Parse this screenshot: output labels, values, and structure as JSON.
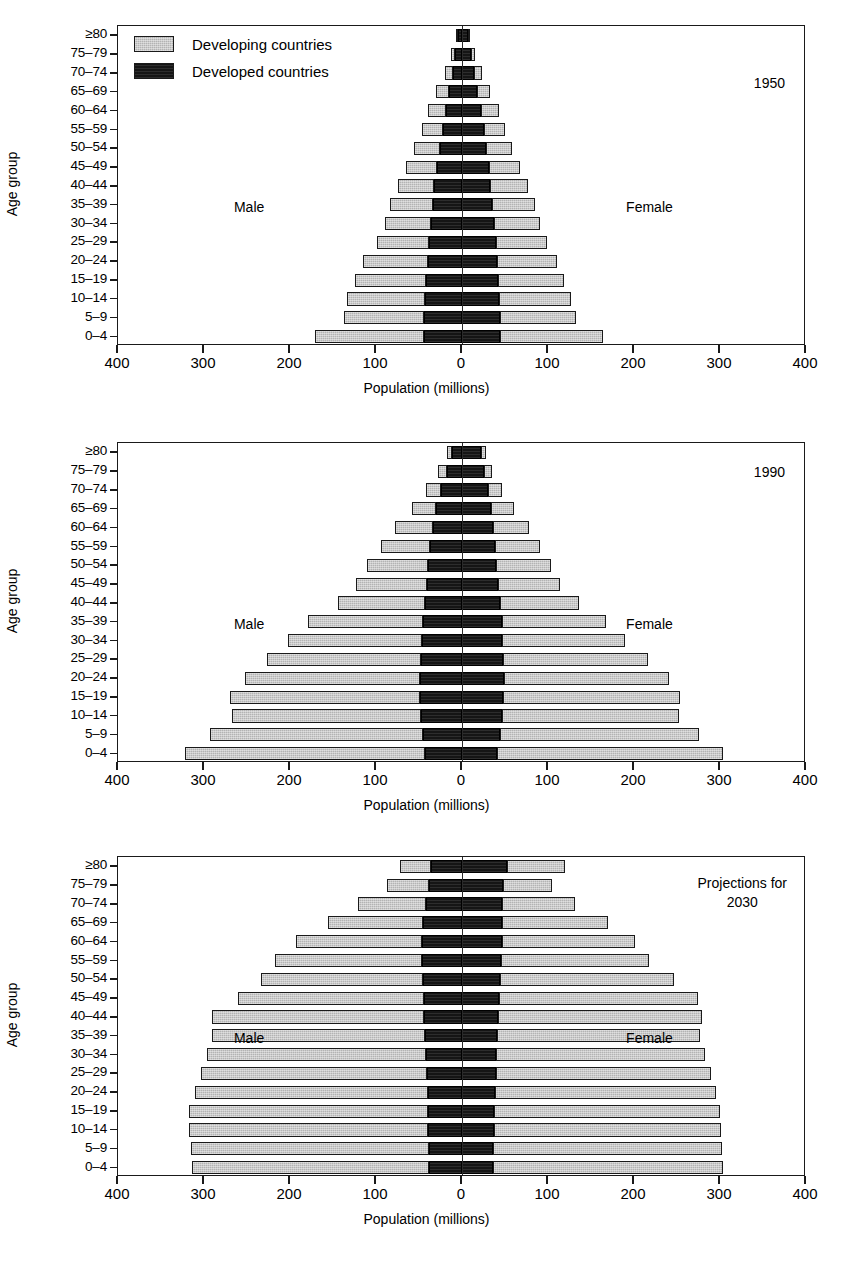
{
  "figure": {
    "axis_title_x": "Population (millions)",
    "axis_title_y": "Age group",
    "male_label": "Male",
    "female_label": "Female",
    "x_tick_labels": [
      "400",
      "300",
      "200",
      "100",
      "0",
      "100",
      "200",
      "300",
      "400"
    ],
    "x_tick_values": [
      -400,
      -300,
      -200,
      -100,
      0,
      100,
      200,
      300,
      400
    ],
    "xlim": [
      -400,
      400
    ],
    "age_groups": [
      "≥80",
      "75–79",
      "70–74",
      "65–69",
      "60–64",
      "55–59",
      "50–54",
      "45–49",
      "40–44",
      "35–39",
      "30–34",
      "25–29",
      "20–24",
      "15–19",
      "10–14",
      "5–9",
      "0–4"
    ],
    "legend": {
      "items": [
        {
          "label": "Developing countries",
          "key": "developing",
          "color": "#b3b3b3"
        },
        {
          "label": "Developed countries",
          "key": "developed",
          "color": "#151515"
        }
      ]
    }
  },
  "chart_data": [
    {
      "type": "bar",
      "subtype": "population-pyramid",
      "title": "1950",
      "panel_label": "1950",
      "panel_label_lines": [
        "1950"
      ],
      "xlabel": "Population (millions)",
      "ylabel": "Age group",
      "xlim": [
        -400,
        400
      ],
      "grid": false,
      "legend_position": "top-left",
      "categories": [
        "≥80",
        "75–79",
        "70–74",
        "65–69",
        "60–64",
        "55–59",
        "50–54",
        "45–49",
        "40–44",
        "35–39",
        "30–34",
        "25–29",
        "20–24",
        "15–19",
        "10–14",
        "5–9",
        "0–4"
      ],
      "series": [
        {
          "name": "Male developed",
          "side": "male",
          "group": "developed",
          "values": [
            5,
            8,
            11,
            15,
            19,
            22,
            26,
            29,
            32,
            34,
            36,
            38,
            40,
            42,
            43,
            44,
            44
          ]
        },
        {
          "name": "Male developing",
          "side": "male",
          "group": "developing",
          "values": [
            2,
            5,
            9,
            15,
            21,
            25,
            30,
            36,
            42,
            50,
            54,
            61,
            75,
            83,
            91,
            93,
            127
          ]
        },
        {
          "name": "Female developed",
          "side": "female",
          "group": "developed",
          "values": [
            7,
            10,
            14,
            18,
            22,
            25,
            28,
            31,
            33,
            35,
            37,
            39,
            41,
            42,
            43,
            44,
            44
          ]
        },
        {
          "name": "Female developing",
          "side": "female",
          "group": "developing",
          "values": [
            2,
            5,
            9,
            15,
            21,
            25,
            30,
            37,
            44,
            50,
            54,
            60,
            70,
            77,
            84,
            89,
            120
          ]
        }
      ]
    },
    {
      "type": "bar",
      "subtype": "population-pyramid",
      "title": "1990",
      "panel_label": "1990",
      "panel_label_lines": [
        "1990"
      ],
      "xlabel": "Population (millions)",
      "ylabel": "Age group",
      "xlim": [
        -400,
        400
      ],
      "grid": false,
      "legend_position": "none",
      "categories": [
        "≥80",
        "75–79",
        "70–74",
        "65–69",
        "60–64",
        "55–59",
        "50–54",
        "45–49",
        "40–44",
        "35–39",
        "30–34",
        "25–29",
        "20–24",
        "15–19",
        "10–14",
        "5–9",
        "0–4"
      ],
      "series": [
        {
          "name": "Male developed",
          "side": "male",
          "group": "developed",
          "values": [
            12,
            18,
            24,
            30,
            34,
            37,
            39,
            41,
            43,
            45,
            47,
            48,
            49,
            49,
            48,
            45,
            43
          ]
        },
        {
          "name": "Male developing",
          "side": "female_na",
          "group": "developing",
          "values": [
            6,
            10,
            18,
            28,
            44,
            57,
            72,
            82,
            101,
            134,
            155,
            179,
            203,
            221,
            219,
            248,
            279
          ]
        },
        {
          "name": "Female developed",
          "side": "female",
          "group": "developed",
          "values": [
            22,
            26,
            30,
            34,
            36,
            38,
            40,
            42,
            44,
            46,
            47,
            48,
            49,
            48,
            47,
            44,
            41
          ]
        },
        {
          "name": "Female developing",
          "side": "female",
          "group": "developing",
          "values": [
            6,
            9,
            17,
            26,
            42,
            53,
            64,
            72,
            92,
            122,
            143,
            168,
            192,
            205,
            205,
            232,
            263
          ]
        }
      ]
    },
    {
      "type": "bar",
      "subtype": "population-pyramid",
      "title": "Projections for 2030",
      "panel_label": "Projections for 2030",
      "panel_label_lines": [
        "Projections for",
        "2030"
      ],
      "xlabel": "Population (millions)",
      "ylabel": "Age group",
      "xlim": [
        -400,
        400
      ],
      "grid": false,
      "legend_position": "none",
      "categories": [
        "≥80",
        "75–79",
        "70–74",
        "65–69",
        "60–64",
        "55–59",
        "50–54",
        "45–49",
        "40–44",
        "35–39",
        "30–34",
        "25–29",
        "20–24",
        "15–19",
        "10–14",
        "5–9",
        "0–4"
      ],
      "series": [
        {
          "name": "Male developed",
          "side": "male",
          "group": "developed",
          "values": [
            36,
            38,
            42,
            45,
            46,
            46,
            45,
            44,
            44,
            43,
            42,
            41,
            40,
            39,
            39,
            38,
            38
          ]
        },
        {
          "name": "Male developing",
          "side": "male",
          "group": "developing",
          "values": [
            36,
            49,
            79,
            111,
            147,
            172,
            189,
            217,
            247,
            248,
            254,
            263,
            271,
            278,
            278,
            277,
            276
          ]
        },
        {
          "name": "Female developed",
          "side": "female",
          "group": "developed",
          "values": [
            52,
            48,
            47,
            47,
            46,
            45,
            44,
            43,
            42,
            41,
            40,
            39,
            38,
            37,
            37,
            36,
            36
          ]
        },
        {
          "name": "Female developing",
          "side": "female",
          "group": "developing",
          "values": [
            68,
            57,
            84,
            123,
            155,
            172,
            202,
            231,
            237,
            236,
            243,
            250,
            257,
            263,
            264,
            266,
            268
          ]
        }
      ]
    }
  ]
}
